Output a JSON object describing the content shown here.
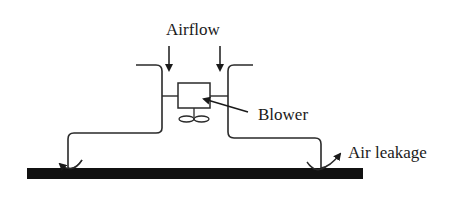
{
  "diagram": {
    "labels": {
      "airflow": "Airflow",
      "blower": "Blower",
      "air_leakage": "Air leakage"
    },
    "colors": {
      "line": "#2a2a2a",
      "floor": "#111111",
      "background": "#ffffff"
    }
  }
}
